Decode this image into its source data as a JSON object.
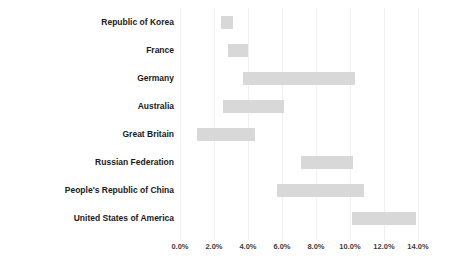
{
  "chart_data": {
    "type": "bar",
    "subtype": "floating-range-bar",
    "title": "",
    "subtitle": "",
    "xlabel": "",
    "ylabel": "",
    "xlim": [
      0.0,
      14.0
    ],
    "xtick_format": "percent",
    "grid": true,
    "legend": false,
    "orientation": "horizontal",
    "bar_color": "#d8d8d8",
    "categories": [
      "Republic of Korea",
      "France",
      "Germany",
      "Australia",
      "Great Britain",
      "Russian Federation",
      "People's Republic of China",
      "United States of America"
    ],
    "xticks": [
      0.0,
      2.0,
      4.0,
      6.0,
      8.0,
      10.0,
      12.0,
      14.0
    ],
    "xtick_labels": [
      "0.0%",
      "2.0%",
      "4.0%",
      "6.0%",
      "8.0%",
      "10.0%",
      "12.0%",
      "14.0%"
    ],
    "bars": [
      {
        "category": "Republic of Korea",
        "start": 2.4,
        "end": 3.1,
        "length": 0.7
      },
      {
        "category": "France",
        "start": 2.8,
        "end": 4.0,
        "length": 1.2
      },
      {
        "category": "Germany",
        "start": 3.7,
        "end": 10.3,
        "length": 6.6
      },
      {
        "category": "Australia",
        "start": 2.5,
        "end": 6.1,
        "length": 3.6
      },
      {
        "category": "Great Britain",
        "start": 1.0,
        "end": 4.4,
        "length": 3.4
      },
      {
        "category": "Russian Federation",
        "start": 7.1,
        "end": 10.2,
        "length": 3.1
      },
      {
        "category": "People's Republic of China",
        "start": 5.7,
        "end": 10.8,
        "length": 5.1
      },
      {
        "category": "United States of America",
        "start": 10.1,
        "end": 13.9,
        "length": 3.8
      }
    ]
  }
}
